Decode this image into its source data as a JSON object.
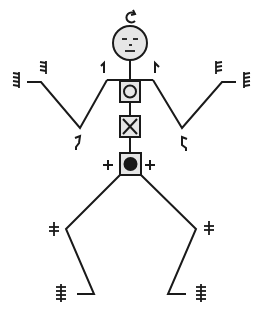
{
  "figure": {
    "colors": {
      "stroke": "#1a1a1a",
      "head_fill": "#e6e6e6",
      "box_fill": "#e6e6e6",
      "background": "#ffffff"
    },
    "head": {
      "top_symbol": "rotate-arrow",
      "face": "neutral-face"
    },
    "torso_boxes": [
      {
        "symbol": "circle-outline"
      },
      {
        "symbol": "x-cross"
      },
      {
        "symbol": "filled-circle"
      }
    ],
    "hip_markers": [
      "+",
      "+"
    ],
    "arm_markers": {
      "left_shoulder": "hook-up-left",
      "right_shoulder": "hook-up-right",
      "left_elbow": "hook-down-left",
      "right_elbow": "hook-down-right",
      "left_wrist": "three-tick",
      "right_wrist": "three-tick",
      "left_hand": "four-tick",
      "right_hand": "four-tick"
    },
    "leg_markers": {
      "left_knee": "two-bar",
      "right_knee": "two-bar",
      "left_foot": "four-bar",
      "right_foot": "four-bar"
    }
  }
}
